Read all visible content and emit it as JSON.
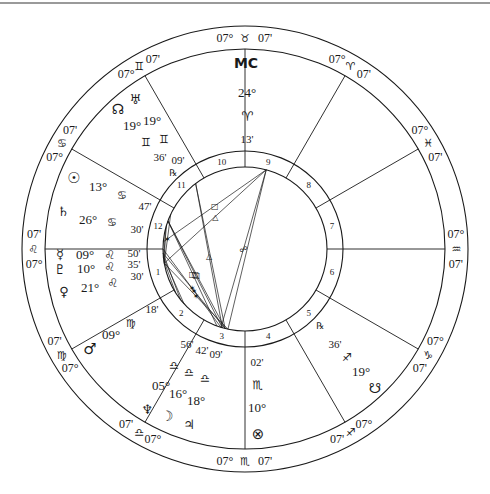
{
  "chart": {
    "center": [
      245,
      249
    ],
    "radii": {
      "outer": 223,
      "zodiac_inner": 200,
      "house_outer": 98,
      "house_inner": 82
    },
    "colors": {
      "line": "#1a1a1a",
      "rule": "#9a9a9a",
      "background": "#ffffff"
    }
  },
  "sign_cusps": [
    {
      "angle": 90,
      "deg": "07°",
      "glyph": "♉",
      "min": "07'",
      "sign": "Taurus"
    },
    {
      "angle": 60,
      "deg": "07°",
      "glyph": "♈",
      "min": "07'",
      "sign": "Aries"
    },
    {
      "angle": 30,
      "deg": "07°",
      "glyph": "♓",
      "min": "07'",
      "sign": "Pisces"
    },
    {
      "angle": 0,
      "deg": "07°",
      "glyph": "♒",
      "min": "07'",
      "sign": "Aquarius"
    },
    {
      "angle": 330,
      "deg": "07°",
      "glyph": "♑",
      "min": "07'",
      "sign": "Capricorn"
    },
    {
      "angle": 300,
      "deg": "07°",
      "glyph": "♐",
      "min": "07'",
      "sign": "Sagittarius"
    },
    {
      "angle": 270,
      "deg": "07°",
      "glyph": "♏",
      "min": "07'",
      "sign": "Scorpio"
    },
    {
      "angle": 240,
      "deg": "07°",
      "glyph": "♎",
      "min": "07'",
      "sign": "Libra"
    },
    {
      "angle": 210,
      "deg": "07°",
      "glyph": "♍",
      "min": "07'",
      "sign": "Virgo"
    },
    {
      "angle": 180,
      "deg": "07°",
      "glyph": "♌",
      "min": "07'",
      "sign": "Leo"
    },
    {
      "angle": 150,
      "deg": "07°",
      "glyph": "♋",
      "min": "07'",
      "sign": "Cancer"
    },
    {
      "angle": 120,
      "deg": "07°",
      "glyph": "♊",
      "min": "07'",
      "sign": "Gemini"
    }
  ],
  "houses": [
    "1",
    "2",
    "3",
    "4",
    "5",
    "6",
    "7",
    "8",
    "9",
    "10",
    "11",
    "12"
  ],
  "house_label_angles": [
    195,
    225,
    255,
    285,
    315,
    345,
    15,
    45,
    75,
    105,
    135,
    165
  ],
  "planet_labels": [
    {
      "name": "mc",
      "glyph": "MC",
      "x": 246,
      "y": 68,
      "size": 14
    },
    {
      "name": "mc-deg",
      "text": "24°",
      "x": 247,
      "y": 97,
      "size": 13
    },
    {
      "name": "mc-sign",
      "glyph": "♈",
      "x": 247,
      "y": 121,
      "size": 13
    },
    {
      "name": "mc-min",
      "text": "13'",
      "x": 247,
      "y": 143,
      "size": 11
    },
    {
      "name": "uranus",
      "glyph": "♅",
      "x": 135,
      "y": 104,
      "size": 13
    },
    {
      "name": "north-node",
      "glyph": "☊",
      "x": 118,
      "y": 114,
      "size": 14
    },
    {
      "name": "uranus-deg",
      "text": "19°",
      "x": 152,
      "y": 125,
      "size": 13
    },
    {
      "name": "node-deg",
      "text": "19°",
      "x": 132,
      "y": 130,
      "size": 13
    },
    {
      "name": "node-sign",
      "glyph": "♊",
      "x": 146,
      "y": 146,
      "size": 11
    },
    {
      "name": "uranus-sign",
      "glyph": "♊",
      "x": 164,
      "y": 143,
      "size": 11
    },
    {
      "name": "node-min",
      "text": "36'",
      "x": 160,
      "y": 161,
      "size": 11
    },
    {
      "name": "uranus-min",
      "text": "09'",
      "x": 178,
      "y": 164,
      "size": 11
    },
    {
      "name": "uranus-retro",
      "glyph": "℞",
      "x": 173,
      "y": 176,
      "size": 9
    },
    {
      "name": "sun",
      "glyph": "☉",
      "x": 74,
      "y": 183,
      "size": 15
    },
    {
      "name": "sun-deg",
      "text": "13°",
      "x": 98,
      "y": 191,
      "size": 13
    },
    {
      "name": "sun-sign",
      "glyph": "♋",
      "x": 122,
      "y": 199,
      "size": 11
    },
    {
      "name": "sun-min",
      "text": "47'",
      "x": 145,
      "y": 210,
      "size": 11
    },
    {
      "name": "saturn",
      "glyph": "♄",
      "x": 63,
      "y": 216,
      "size": 13
    },
    {
      "name": "saturn-deg",
      "text": "26°",
      "x": 88,
      "y": 224,
      "size": 13
    },
    {
      "name": "saturn-sign",
      "glyph": "♋",
      "x": 112,
      "y": 226,
      "size": 11
    },
    {
      "name": "saturn-min",
      "text": "30'",
      "x": 137,
      "y": 233,
      "size": 11
    },
    {
      "name": "mercury",
      "glyph": "☿",
      "x": 60,
      "y": 259,
      "size": 13
    },
    {
      "name": "mercury-deg",
      "text": "09°",
      "x": 85,
      "y": 259,
      "size": 13
    },
    {
      "name": "mercury-sign",
      "glyph": "♌",
      "x": 110,
      "y": 259,
      "size": 12
    },
    {
      "name": "mercury-min",
      "text": "50'",
      "x": 134,
      "y": 257,
      "size": 11
    },
    {
      "name": "pluto",
      "glyph": "♇",
      "x": 60,
      "y": 274,
      "size": 13
    },
    {
      "name": "pluto-deg",
      "text": "10°",
      "x": 86,
      "y": 273,
      "size": 13
    },
    {
      "name": "pluto-sign",
      "glyph": "♌",
      "x": 110,
      "y": 271,
      "size": 12
    },
    {
      "name": "pluto-min",
      "text": "35'",
      "x": 134,
      "y": 268,
      "size": 11
    },
    {
      "name": "venus",
      "glyph": "♀",
      "x": 64,
      "y": 296,
      "size": 13
    },
    {
      "name": "venus-deg",
      "text": "21°",
      "x": 90,
      "y": 292,
      "size": 13
    },
    {
      "name": "venus-sign",
      "glyph": "♌",
      "x": 113,
      "y": 287,
      "size": 12
    },
    {
      "name": "venus-min",
      "text": "30'",
      "x": 137,
      "y": 280,
      "size": 11
    },
    {
      "name": "mars-min",
      "text": "18'",
      "x": 152,
      "y": 313,
      "size": 11
    },
    {
      "name": "mars-sign",
      "glyph": "♍",
      "x": 131,
      "y": 327,
      "size": 11
    },
    {
      "name": "mars-deg",
      "text": "09°",
      "x": 111,
      "y": 339,
      "size": 13
    },
    {
      "name": "mars",
      "glyph": "♂",
      "x": 90,
      "y": 354,
      "size": 15
    },
    {
      "name": "neptune-min",
      "text": "56'",
      "x": 187,
      "y": 348,
      "size": 11
    },
    {
      "name": "moon-min",
      "text": "42'",
      "x": 202,
      "y": 354,
      "size": 11
    },
    {
      "name": "jupiter-min",
      "text": "09'",
      "x": 216,
      "y": 358,
      "size": 11
    },
    {
      "name": "neptune-sign",
      "glyph": "♎",
      "x": 174,
      "y": 369,
      "size": 11
    },
    {
      "name": "moon-sign",
      "glyph": "♎",
      "x": 189,
      "y": 376,
      "size": 11
    },
    {
      "name": "jupiter-sign",
      "glyph": "♎",
      "x": 205,
      "y": 382,
      "size": 11
    },
    {
      "name": "neptune-deg",
      "text": "05°",
      "x": 161,
      "y": 390,
      "size": 13
    },
    {
      "name": "moon-deg",
      "text": "16°",
      "x": 178,
      "y": 398,
      "size": 13
    },
    {
      "name": "jupiter-deg",
      "text": "18°",
      "x": 196,
      "y": 405,
      "size": 13
    },
    {
      "name": "neptune",
      "glyph": "♆",
      "x": 147,
      "y": 414,
      "size": 13
    },
    {
      "name": "moon",
      "glyph": "☽",
      "x": 167,
      "y": 421,
      "size": 14
    },
    {
      "name": "jupiter",
      "glyph": "♃",
      "x": 189,
      "y": 429,
      "size": 13
    },
    {
      "name": "pof-min",
      "text": "02'",
      "x": 257,
      "y": 366,
      "size": 11
    },
    {
      "name": "pof-sign",
      "glyph": "♏",
      "x": 258,
      "y": 389,
      "size": 12
    },
    {
      "name": "pof-deg",
      "text": "10°",
      "x": 257,
      "y": 412,
      "size": 13
    },
    {
      "name": "part-of-fortune",
      "glyph": "⊗",
      "x": 258,
      "y": 439,
      "size": 15
    },
    {
      "name": "snode-retro",
      "glyph": "℞",
      "x": 320,
      "y": 329,
      "size": 9
    },
    {
      "name": "snode-min",
      "text": "36'",
      "x": 335,
      "y": 348,
      "size": 11
    },
    {
      "name": "snode-sign",
      "glyph": "♐",
      "x": 347,
      "y": 361,
      "size": 11
    },
    {
      "name": "snode-deg",
      "text": "19°",
      "x": 361,
      "y": 376,
      "size": 13
    },
    {
      "name": "south-node",
      "glyph": "☋",
      "x": 375,
      "y": 393,
      "size": 14
    }
  ],
  "aspect_lines": [
    {
      "from": 175,
      "to": 75,
      "type": "square",
      "mid": "□"
    },
    {
      "from": 190,
      "to": 75,
      "type": "trine",
      "mid": "△"
    },
    {
      "from": 155,
      "to": 190,
      "type": "sextile",
      "mid": "✶"
    },
    {
      "from": 127,
      "to": 254,
      "type": "trine",
      "mid": "△"
    },
    {
      "from": 127,
      "to": 256,
      "type": "trine",
      "mid": ""
    },
    {
      "from": 75,
      "to": 253,
      "type": "opposition",
      "mid": "☍"
    },
    {
      "from": 75,
      "to": 258,
      "type": "opposition",
      "mid": ""
    },
    {
      "from": 160,
      "to": 250,
      "type": "square",
      "mid": "□"
    },
    {
      "from": 160,
      "to": 254,
      "type": "square",
      "mid": "□"
    },
    {
      "from": 160,
      "to": 256,
      "type": "square",
      "mid": "□"
    },
    {
      "from": 180,
      "to": 253,
      "type": "sextile",
      "mid": "✶"
    },
    {
      "from": 183,
      "to": 256,
      "type": "sextile",
      "mid": "✶"
    },
    {
      "from": 190,
      "to": 258,
      "type": "sextile",
      "mid": "✶"
    },
    {
      "from": 183,
      "to": 218,
      "type": "sextile",
      "mid": ""
    },
    {
      "from": 186,
      "to": 222,
      "type": "sextile",
      "mid": ""
    },
    {
      "from": 188,
      "to": 212,
      "type": "sextile",
      "mid": ""
    },
    {
      "from": 163,
      "to": 186,
      "type": "conj",
      "mid": ""
    },
    {
      "from": 166,
      "to": 190,
      "type": "conj",
      "mid": ""
    }
  ]
}
